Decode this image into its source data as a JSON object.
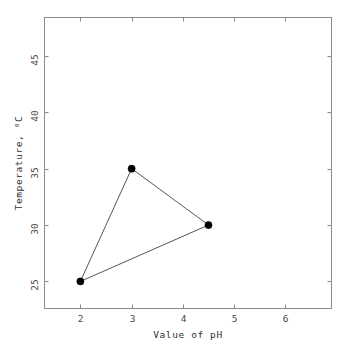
{
  "chart_data": {
    "type": "line",
    "title": "",
    "xlabel": "Value of pH",
    "ylabel": "Temperature, ⁰C",
    "xlim": [
      1.3,
      6.9
    ],
    "ylim": [
      22.6,
      48.4
    ],
    "xticks": [
      2,
      3,
      4,
      5,
      6
    ],
    "xtick_labels": [
      "2",
      "3",
      "4",
      "5",
      "6"
    ],
    "yticks": [
      25,
      30,
      35,
      40,
      45
    ],
    "ytick_labels": [
      "25",
      "30",
      "35",
      "40",
      "45"
    ],
    "grid": false,
    "legend": null,
    "closed_path": true,
    "marker": "filled-circle",
    "series": [
      {
        "name": "pH vs Temperature",
        "x": [
          2,
          3,
          4.5,
          2
        ],
        "y": [
          25,
          35,
          30,
          25
        ],
        "points": [
          {
            "x": 2,
            "y": 25
          },
          {
            "x": 3,
            "y": 35
          },
          {
            "x": 4.5,
            "y": 30
          }
        ]
      }
    ],
    "colors": {
      "line": "#55565c",
      "marker": "#000000",
      "frame": "#8a8a8a",
      "background": "#ffffff",
      "text": "#333333"
    }
  }
}
